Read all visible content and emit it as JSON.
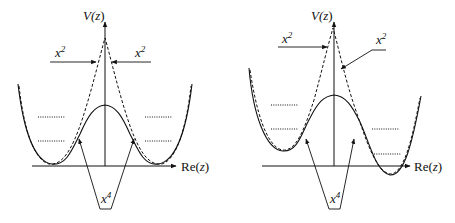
{
  "figure": {
    "panels": [
      {
        "id": "symmetric",
        "y_axis_label_prefix": "V(",
        "y_axis_label_var": "z",
        "y_axis_label_suffix": ")",
        "x_axis_label_prefix": "Re(",
        "x_axis_label_var": "z",
        "x_axis_label_suffix": ")",
        "annotations": [
          {
            "base": "x",
            "exp": "2",
            "target": "dashed peak, left side"
          },
          {
            "base": "x",
            "exp": "2",
            "target": "dashed peak, right side"
          },
          {
            "base": "x",
            "exp": "4",
            "target": "solid curve hump"
          }
        ],
        "curves": [
          {
            "name": "quartic potential",
            "style": "solid"
          },
          {
            "name": "harmonic approximations",
            "style": "dashed"
          }
        ],
        "energy_levels": {
          "style": "dotted",
          "count_per_well": 2
        }
      },
      {
        "id": "asymmetric",
        "y_axis_label_prefix": "V(",
        "y_axis_label_var": "z",
        "y_axis_label_suffix": ")",
        "x_axis_label_prefix": "Re(",
        "x_axis_label_var": "z",
        "x_axis_label_suffix": ")",
        "annotations": [
          {
            "base": "x",
            "exp": "2",
            "target": "dashed peak, left side"
          },
          {
            "base": "x",
            "exp": "2",
            "target": "dashed peak, right side"
          },
          {
            "base": "x",
            "exp": "4",
            "target": "solid curve hump"
          }
        ],
        "curves": [
          {
            "name": "asymmetric quartic potential",
            "style": "solid"
          },
          {
            "name": "harmonic approximations",
            "style": "dashed"
          }
        ],
        "energy_levels": {
          "style": "dotted",
          "left_well": 2,
          "right_well": 2
        }
      }
    ],
    "colors": {
      "ink": "#111111",
      "background": "#ffffff"
    }
  }
}
